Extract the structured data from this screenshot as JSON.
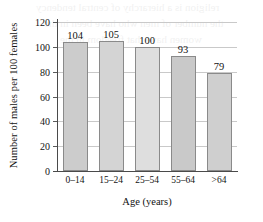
{
  "chart_data": {
    "type": "bar",
    "title": "",
    "categories": [
      "0–14",
      "15–24",
      "25–54",
      "55–64",
      ">64"
    ],
    "values": [
      104,
      105,
      100,
      93,
      79
    ],
    "value_labels": [
      "104",
      "105",
      "100",
      "93",
      "79"
    ],
    "xlabel": "Age (years)",
    "ylabel": "Number of males per 100 females",
    "ylim": [
      0,
      120
    ],
    "yticks": [
      0,
      20,
      40,
      60,
      80,
      100,
      120
    ],
    "ytick_labels": [
      "0",
      "20",
      "40",
      "60",
      "80",
      "100",
      "120"
    ],
    "grid": "horizontal",
    "legend": "none",
    "bar_colors": [
      "#cccccc",
      "#d4d4d4",
      "#dedede",
      "#c9c9c9",
      "#cfcfcf"
    ],
    "bar_border_color": "#8a8a8a",
    "axis_color": "#4a4a4a",
    "gridline_color": "#c9c9c9"
  },
  "artifacts": {
    "bleed_line_1": "religion is a hierarchy of central tendency",
    "bleed_line_2": "the number of men who have been in the",
    "bleed_line_3": "women have that freedom in the"
  }
}
